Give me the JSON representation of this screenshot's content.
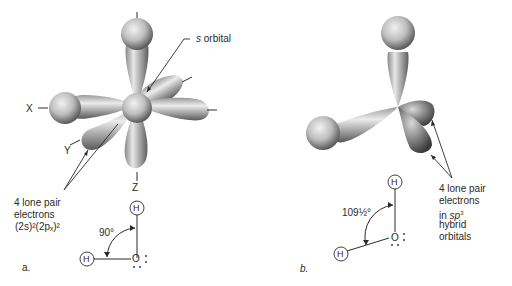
{
  "panel_a": {
    "label": "a.",
    "axis_x": "X",
    "axis_y": "Y",
    "axis_z": "Z",
    "s_orbital_label": "s orbital",
    "lone_pair_line1": "4 lone pair",
    "lone_pair_line2": "electrons",
    "lone_pair_config": "(2s)²(2pₓ)²",
    "angle": "90°",
    "atom_h_top": "H",
    "atom_h_left": "H",
    "atom_o": "O"
  },
  "panel_b": {
    "label": "b.",
    "lone_pair_line1": "4 lone pair",
    "lone_pair_line2": "electrons",
    "lone_pair_line3_prefix": "in ",
    "lone_pair_line3_hyb": "sp",
    "lone_pair_line3_sup": "3",
    "lone_pair_line4": "hybrid",
    "lone_pair_line5": "orbitals",
    "angle": "109½°",
    "atom_h_top": "H",
    "atom_h_left": "H",
    "atom_o": "O"
  },
  "colors": {
    "orbital_light": "#e6e6e6",
    "orbital_mid": "#a8a8a8",
    "orbital_dark": "#555555",
    "ink": "#2a2a2a"
  }
}
